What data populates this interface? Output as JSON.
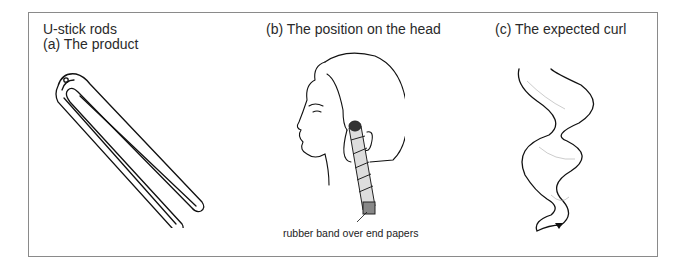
{
  "figure": {
    "title": "U-stick rods",
    "panels": [
      {
        "label": "(a)  The product",
        "illustration": "u-stick-rod"
      },
      {
        "label": "(b)  The position on the head",
        "illustration": "head-profile-with-rod",
        "annotation": "rubber band over end papers"
      },
      {
        "label": "(c)  The expected curl",
        "illustration": "wavy-curl"
      }
    ]
  }
}
